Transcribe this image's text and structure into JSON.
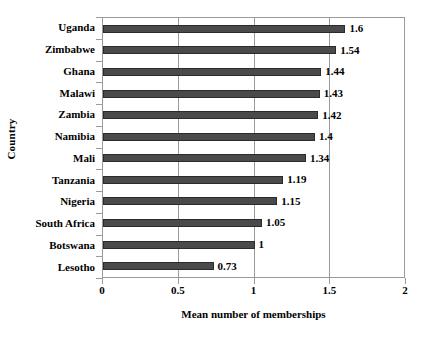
{
  "chart_data": {
    "type": "bar",
    "orientation": "horizontal",
    "title": "",
    "xlabel": "Mean number of memberships",
    "ylabel": "Country",
    "xlim": [
      0,
      2
    ],
    "xticks": [
      "0",
      "0.5",
      "1",
      "1.5",
      "2"
    ],
    "xtick_values": [
      0,
      0.5,
      1,
      1.5,
      2
    ],
    "gridlines": [
      0.5,
      1,
      1.5
    ],
    "grid": true,
    "legend": null,
    "bar_color": "#4a4a4a",
    "bar_border_color": "#2b2b2b",
    "axis_color": "#9a9a9a",
    "categories": [
      "Uganda",
      "Zimbabwe",
      "Ghana",
      "Malawi",
      "Zambia",
      "Namibia",
      "Mali",
      "Tanzania",
      "Nigeria",
      "South Africa",
      "Botswana",
      "Lesotho"
    ],
    "values": [
      1.6,
      1.54,
      1.44,
      1.43,
      1.42,
      1.4,
      1.34,
      1.19,
      1.15,
      1.05,
      1,
      0.73
    ],
    "value_labels": [
      "1.6",
      "1.54",
      "1.44",
      "1.43",
      "1.42",
      "1.4",
      "1.34",
      "1.19",
      "1.15",
      "1.05",
      "1",
      "0.73"
    ]
  }
}
